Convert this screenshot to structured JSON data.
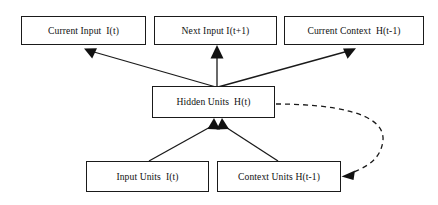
{
  "diagram": {
    "type": "node-link-diagram",
    "background_color": "#ffffff",
    "line_color": "#1a1a1a",
    "nodes": [
      {
        "id": "current-input",
        "label": "Current Input  I(t)",
        "x": 21,
        "y": 16,
        "w": 125,
        "h": 29,
        "font_size": 9.6
      },
      {
        "id": "next-input",
        "label": "Next Input I(t+1)",
        "x": 154,
        "y": 16,
        "w": 123,
        "h": 29,
        "font_size": 9.6
      },
      {
        "id": "current-context",
        "label": "Current Context  H(t-1)",
        "x": 284,
        "y": 16,
        "w": 140,
        "h": 29,
        "font_size": 9.6
      },
      {
        "id": "hidden-units",
        "label": "Hidden Units  H(t)",
        "x": 152,
        "y": 86,
        "w": 123,
        "h": 32,
        "font_size": 9.6
      },
      {
        "id": "input-units",
        "label": "Input Units  I(t)",
        "x": 86,
        "y": 161,
        "w": 123,
        "h": 31,
        "font_size": 9.6
      },
      {
        "id": "context-units",
        "label": "Context Units H(t-1)",
        "x": 217,
        "y": 161,
        "w": 124,
        "h": 31,
        "font_size": 9.6
      }
    ],
    "edges": [
      {
        "id": "hidden-to-current-input",
        "from": "hidden-units",
        "to": "current-input",
        "style": "solid",
        "arrow": "filled-triangle"
      },
      {
        "id": "hidden-to-next-input",
        "from": "hidden-units",
        "to": "next-input",
        "style": "solid",
        "arrow": "filled-triangle"
      },
      {
        "id": "hidden-to-current-context",
        "from": "hidden-units",
        "to": "current-context",
        "style": "solid",
        "arrow": "filled-triangle"
      },
      {
        "id": "input-units-to-hidden",
        "from": "input-units",
        "to": "hidden-units",
        "style": "solid",
        "arrow": "filled-triangle"
      },
      {
        "id": "context-units-to-hidden",
        "from": "context-units",
        "to": "hidden-units",
        "style": "solid",
        "arrow": "filled-triangle"
      },
      {
        "id": "hidden-to-context-units-recurrent",
        "from": "hidden-units",
        "to": "context-units",
        "style": "dashed",
        "arrow": "filled-triangle"
      }
    ]
  }
}
